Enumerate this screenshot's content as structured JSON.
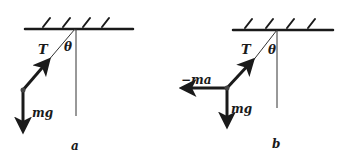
{
  "figure": {
    "panels": [
      {
        "id": "a",
        "caption": "a",
        "labels": {
          "tension": "T",
          "angle": "θ",
          "gravity": "mg"
        }
      },
      {
        "id": "b",
        "caption": "b",
        "labels": {
          "tension": "T",
          "angle": "θ",
          "gravity": "mg",
          "inertial": "−ma"
        }
      }
    ],
    "colors": {
      "ink": "#1a1a1a",
      "background": "#ffffff"
    }
  }
}
